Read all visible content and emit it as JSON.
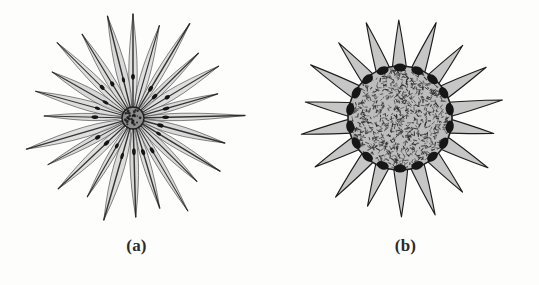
{
  "figure": {
    "background_color": "#fdfdfc",
    "ink_color": "#1d1d1d",
    "fill_gray": "#c6c6c6",
    "body_gray": "#b9b9b9",
    "width": 539,
    "height": 285
  },
  "panels": [
    {
      "id": "a",
      "caption": "(a)",
      "subject": "heliozoan-with-slender-axopodial-rays",
      "center": {
        "x": 133,
        "y": 118
      },
      "nucleus": {
        "radius": 11,
        "fill": "#8d8d8d",
        "outline": "#1d1d1d",
        "granule_count": 26
      },
      "rays": {
        "count": 24,
        "min_length": 88,
        "max_length": 112,
        "half_width": 9,
        "sheath_fill": "#cfcfcf",
        "spine_color": "#262626",
        "granule_color": "#141414",
        "granule_count_per_ray": 1,
        "granule_position_fraction": 0.36,
        "lengths": [
          104,
          96,
          110,
          92,
          100,
          88,
          112,
          95,
          102,
          90,
          108,
          94,
          99,
          106,
          91,
          103,
          97,
          111,
          89,
          101,
          93,
          107,
          98,
          105
        ]
      }
    },
    {
      "id": "b",
      "caption": "(b)",
      "subject": "radiolarian-with-broad-triangular-spines",
      "center": {
        "x": 131,
        "y": 118
      },
      "body": {
        "radius": 52,
        "fill": "#bdbdbd",
        "outline": "#1d1d1d",
        "texture": "dense-squiggle-stipple",
        "texture_mark_count": 900,
        "texture_color": "#2e2e2e"
      },
      "spines": {
        "count": 18,
        "base_half_angle_deg": 9.5,
        "length": 48,
        "fill": "#c6c6c6",
        "outline": "#1d1d1d",
        "nodule_color": "#161616",
        "nodule_radius": 5,
        "lengths": [
          46,
          50,
          44,
          48,
          52,
          43,
          49,
          45,
          51,
          47,
          42,
          50,
          46,
          48,
          44,
          52,
          45,
          49
        ]
      }
    }
  ],
  "chart_data": {
    "type": "diagram",
    "title": "",
    "subtitle": "",
    "panel_labels": [
      "(a)",
      "(b)"
    ],
    "series": [
      {
        "name": "(a) ray lengths (px from center)",
        "values": [
          104,
          96,
          110,
          92,
          100,
          88,
          112,
          95,
          102,
          90,
          108,
          94,
          99,
          106,
          91,
          103,
          97,
          111,
          89,
          101,
          93,
          107,
          98,
          105
        ]
      },
      {
        "name": "(b) spine lengths (px beyond body rim)",
        "values": [
          46,
          50,
          44,
          48,
          52,
          43,
          49,
          45,
          51,
          47,
          42,
          50,
          46,
          48,
          44,
          52,
          45,
          49
        ]
      }
    ],
    "legend_position": "none",
    "grid": false
  }
}
